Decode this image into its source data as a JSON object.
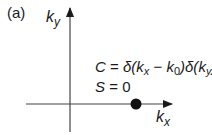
{
  "panel_label": "(a)",
  "axes": {
    "x_label_base": "k",
    "x_label_sub": "x",
    "y_label_base": "k",
    "y_label_sub": "y"
  },
  "equations": {
    "c_lhs": "C",
    "c_eq": " = ",
    "delta1": "δ(",
    "kx_base": "k",
    "kx_sub": "x",
    "minus": " − ",
    "k0_base": "k",
    "k0_sub": "0",
    "close1": ")",
    "delta2": "δ(",
    "ky_base": "k",
    "ky_sub": "y",
    "close2": ")",
    "s_lhs": "S",
    "s_eq": " = ",
    "s_val": "0"
  },
  "point": {
    "label": "k0 point on kx axis"
  },
  "colors": {
    "ink": "#1a1a1a",
    "axis": "#444444"
  }
}
